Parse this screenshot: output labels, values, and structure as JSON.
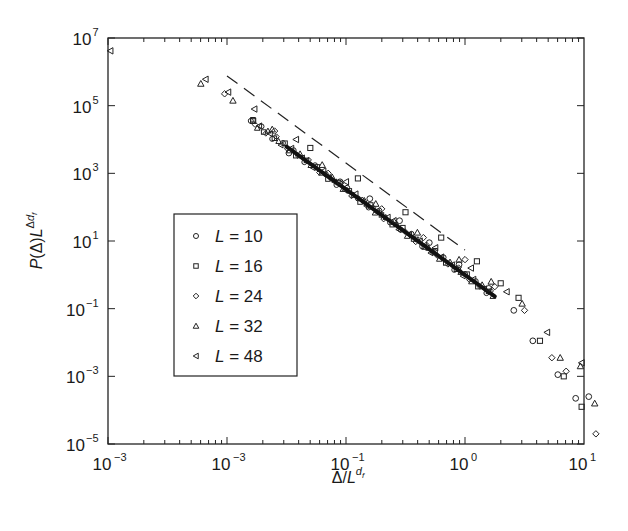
{
  "chart_data": {
    "type": "scatter",
    "title": "",
    "xlabel": "Δ/L^{d_f}",
    "ylabel": "P(Δ)L^{Δd_f}",
    "xscale": "log",
    "yscale": "log",
    "xlim": [
      0.001,
      10
    ],
    "ylim": [
      1e-05,
      10000000.0
    ],
    "grid": false,
    "legend_position": "center-left inside",
    "x_tick_labels": [
      {
        "base": "10",
        "exp": "−3",
        "pos": -3
      },
      {
        "base": "10",
        "exp": "−3",
        "pos": -2
      },
      {
        "base": "10",
        "exp": "−1",
        "pos": -1
      },
      {
        "base": "10",
        "exp": "0",
        "pos": 0
      },
      {
        "base": "10",
        "exp": "1",
        "pos": 1
      }
    ],
    "y_tick_labels": [
      {
        "base": "10",
        "exp": "7",
        "pos": 7
      },
      {
        "base": "10",
        "exp": "5",
        "pos": 5
      },
      {
        "base": "10",
        "exp": "3",
        "pos": 3
      },
      {
        "base": "10",
        "exp": "1",
        "pos": 1
      },
      {
        "base": "10",
        "exp": "−1",
        "pos": -1
      },
      {
        "base": "10",
        "exp": "−3",
        "pos": -3
      },
      {
        "base": "10",
        "exp": "−5",
        "pos": -5
      }
    ],
    "reference_line": {
      "style": "dashed",
      "log_x": [
        -2.0,
        0.0
      ],
      "log_y": [
        5.88,
        0.73
      ],
      "slope": -2.55
    },
    "series": [
      {
        "name": "L = 10",
        "marker": "circle",
        "log_x": [
          -1.48,
          -1.05,
          -0.8,
          -0.55,
          -0.3,
          -0.05,
          0.2,
          0.41,
          0.57,
          0.78,
          0.93,
          1.04
        ],
        "log_y": [
          3.6,
          2.75,
          2.25,
          1.6,
          0.95,
          0.3,
          -0.4,
          -1.05,
          -1.95,
          -2.95,
          -3.65,
          -3.6
        ]
      },
      {
        "name": "L = 16",
        "marker": "square",
        "log_x": [
          -1.78,
          -1.3,
          -0.9,
          -0.5,
          -0.2,
          0.1,
          0.3,
          0.45,
          0.63,
          0.83,
          0.98
        ],
        "log_y": [
          4.55,
          3.75,
          2.85,
          1.85,
          1.1,
          0.4,
          -0.25,
          -0.68,
          -1.95,
          -3.0,
          -3.9
        ]
      },
      {
        "name": "L = 24",
        "marker": "diamond",
        "log_x": [
          -2.02,
          -1.6,
          -1.15,
          -0.7,
          -0.35,
          0.0,
          0.25,
          0.5,
          0.73,
          0.85,
          1.1
        ],
        "log_y": [
          5.35,
          4.25,
          3.0,
          1.95,
          1.1,
          0.45,
          -0.35,
          -1.05,
          -2.45,
          -2.85,
          -4.7
        ]
      },
      {
        "name": "L = 32",
        "marker": "triangle-up",
        "log_x": [
          -2.22,
          -1.95,
          -1.62,
          -1.2,
          -0.75,
          -0.4,
          -0.05,
          0.22,
          0.48,
          0.8,
          0.97,
          1.09
        ],
        "log_y": [
          5.65,
          5.15,
          4.3,
          3.25,
          2.1,
          1.25,
          0.45,
          -0.2,
          -0.85,
          -2.45,
          -2.7,
          -3.8
        ]
      },
      {
        "name": "L = 48",
        "marker": "triangle-left",
        "log_x": [
          -2.98,
          -2.18,
          -1.99,
          -1.77,
          -1.42,
          -1.0,
          -0.6,
          -0.25,
          0.05,
          0.35,
          0.69,
          0.98
        ],
        "log_y": [
          6.62,
          5.78,
          5.4,
          4.9,
          4.0,
          2.75,
          1.6,
          0.8,
          0.2,
          -0.5,
          -1.7,
          -2.6
        ]
      }
    ],
    "dense_band": {
      "description": "overlapping markers of all series along collapse curve",
      "log_x_range": [
        -1.8,
        0.25
      ],
      "log_y_start": 4.55,
      "slope": -2.53
    }
  }
}
